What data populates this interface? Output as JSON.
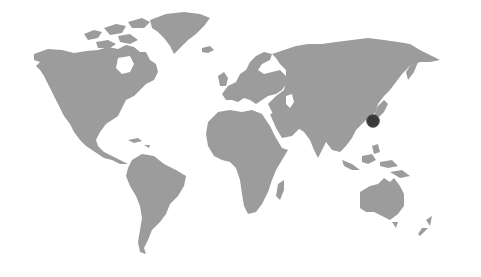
{
  "map": {
    "type": "world-map",
    "projection": "equirectangular-like",
    "land_color": "#9c9c9c",
    "background_color": "#ffffff",
    "markers": [
      {
        "name": "Japan",
        "label": "",
        "x": 373,
        "y": 121,
        "r": 6.5,
        "color": "#3a3a3a"
      }
    ]
  }
}
